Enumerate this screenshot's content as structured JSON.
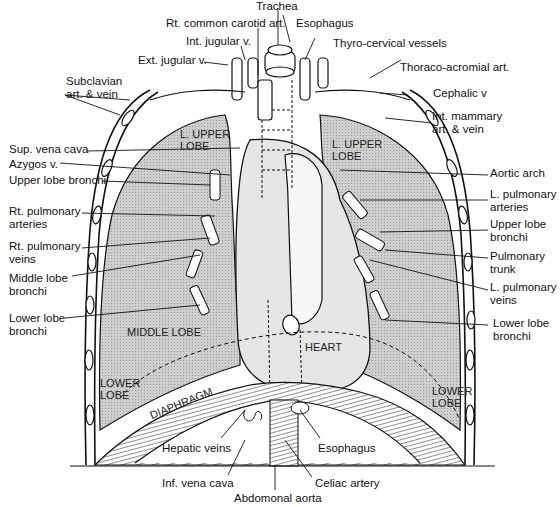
{
  "figure": {
    "colors": {
      "lung_fill": "#c8c8c8",
      "line": "#111111",
      "background": "#ffffff",
      "heart_fill": "#e6e6e6"
    }
  },
  "labels_top": {
    "trachea": "Trachea",
    "esophagus_top": "Esophagus",
    "rt_common_carotid": "Rt. common carotid art.",
    "thyro_cervical": "Thyro-cervical vessels",
    "int_jugular": "Int. jugular v.",
    "ext_jugular": "Ext. jugular v.",
    "thoraco_acromial": "Thoraco-acromial art."
  },
  "labels_left": {
    "subclavian_1": "Subclavian",
    "subclavian_2": "art. & vein",
    "sup_vena_cava": "Sup. vena cava",
    "azygos": "Azygos v.",
    "upper_lobe_bronchi_r": "Upper lobe bronchi",
    "rt_pulm_art_1": "Rt. pulmonary",
    "rt_pulm_art_2": "arteries",
    "rt_pulm_veins_1": "Rt. pulmonary",
    "rt_pulm_veins_2": "veins",
    "middle_lobe_bronchi_1": "Middle lobe",
    "middle_lobe_bronchi_2": "bronchi",
    "lower_lobe_bronchi_r_1": "Lower lobe",
    "lower_lobe_bronchi_r_2": "bronchi"
  },
  "labels_right": {
    "cephalic": "Cephalic v",
    "int_mammary_1": "Int. mammary",
    "int_mammary_2": "art. & vein",
    "aortic_arch": "Aortic arch",
    "l_pulm_art_1": "L. pulmonary",
    "l_pulm_art_2": "arteries",
    "upper_lobe_bronchi_l_1": "Upper lobe",
    "upper_lobe_bronchi_l_2": "bronchi",
    "pulm_trunk_1": "Pulmonary",
    "pulm_trunk_2": "trunk",
    "l_pulm_veins_1": "L. pulmonary",
    "l_pulm_veins_2": "veins",
    "lower_lobe_bronchi_l_1": "Lower lobe",
    "lower_lobe_bronchi_l_2": "bronchi"
  },
  "labels_bottom": {
    "hepatic_veins": "Hepatic veins",
    "esophagus_bottom": "Esophagus",
    "inf_vena_cava": "Inf. vena cava",
    "celiac_artery": "Celiac artery",
    "abdominal_aorta": "Abdomonal aorta"
  },
  "labels_inner": {
    "r_upper_lobe_1": "L. UPPER",
    "r_upper_lobe_2": "LOBE",
    "l_upper_lobe_1": "L. UPPER",
    "l_upper_lobe_2": "LOBE",
    "middle_lobe": "MIDDLE LOBE",
    "heart": "HEART",
    "r_lower_lobe_1": "LOWER",
    "r_lower_lobe_2": "LOBE",
    "l_lower_lobe_1": "LOWER",
    "l_lower_lobe_2": "LOBE",
    "diaphragm": "DIAPHRAGM"
  }
}
